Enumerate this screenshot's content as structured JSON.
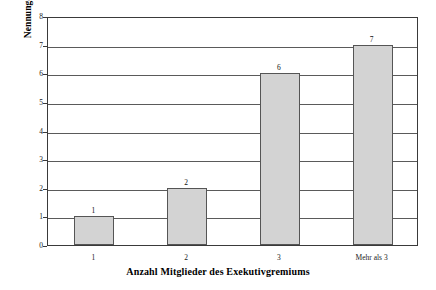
{
  "chart_data": {
    "type": "bar",
    "title": "",
    "xlabel": "Anzahl Mitglieder des Exekutivgremiums",
    "ylabel": "Nennungen [N=16]",
    "categories": [
      "1",
      "2",
      "3",
      "Mehr als 3"
    ],
    "values": [
      1,
      2,
      6,
      7
    ],
    "value_labels": [
      "1",
      "2",
      "6",
      "7"
    ],
    "ylim": [
      0,
      8
    ],
    "ytick_labels": [
      "0",
      "1",
      "2",
      "3",
      "4",
      "5",
      "6",
      "7",
      "8"
    ],
    "ytick_values": [
      0,
      1,
      2,
      3,
      4,
      5,
      6,
      7,
      8
    ],
    "grid": true,
    "legend": false,
    "bar_color": "#d3d3d3",
    "bar_edge_color": "#555555",
    "background_color": "#ffffff",
    "axis_color": "#3a3a3a"
  }
}
